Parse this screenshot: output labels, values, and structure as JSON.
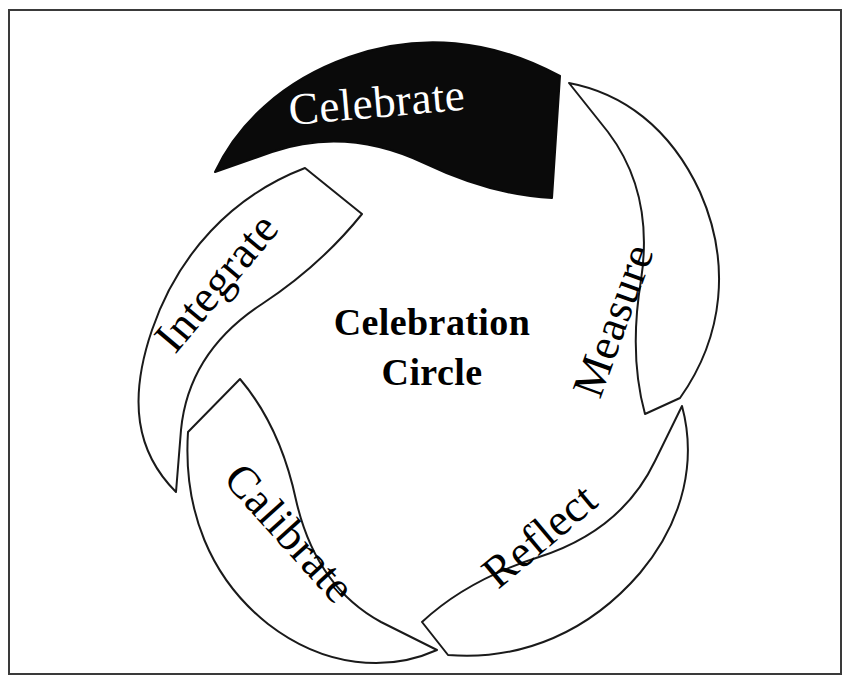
{
  "diagram": {
    "type": "cycle-pinwheel",
    "center_title_line1": "Celebration",
    "center_title_line2": "Circle",
    "background_color": "#ffffff",
    "stroke_color": "#1a1a1a",
    "highlight_fill": "#0a0a0a",
    "highlight_text_color": "#ffffff",
    "frame_color": "#3a3a3a",
    "segments": [
      {
        "id": "celebrate",
        "label": "Celebrate",
        "highlighted": true,
        "position": "top"
      },
      {
        "id": "measure",
        "label": "Measure",
        "highlighted": false,
        "position": "upper-right"
      },
      {
        "id": "reflect",
        "label": "Reflect",
        "highlighted": false,
        "position": "lower-right"
      },
      {
        "id": "calibrate",
        "label": "Calibrate",
        "highlighted": false,
        "position": "lower-left"
      },
      {
        "id": "integrate",
        "label": "Integrate",
        "highlighted": false,
        "position": "upper-left"
      }
    ]
  }
}
